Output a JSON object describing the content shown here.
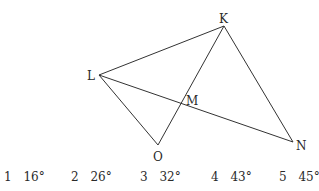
{
  "figure": {
    "points": {
      "K": {
        "label": "K",
        "x": 224,
        "y": 26
      },
      "L": {
        "label": "L",
        "x": 99,
        "y": 75
      },
      "M": {
        "label": "M",
        "x": 181,
        "y": 102
      },
      "O": {
        "label": "O",
        "x": 158,
        "y": 145
      },
      "N": {
        "label": "N",
        "x": 293,
        "y": 142
      }
    },
    "segments": [
      [
        "L",
        "K"
      ],
      [
        "K",
        "N"
      ],
      [
        "L",
        "N"
      ],
      [
        "L",
        "O"
      ],
      [
        "O",
        "K"
      ]
    ],
    "line_color": "#333333"
  },
  "options": [
    {
      "num": "1",
      "value": "16°"
    },
    {
      "num": "2",
      "value": "26°"
    },
    {
      "num": "3",
      "value": "32°"
    },
    {
      "num": "4",
      "value": "43°"
    },
    {
      "num": "5",
      "value": "45°"
    }
  ]
}
